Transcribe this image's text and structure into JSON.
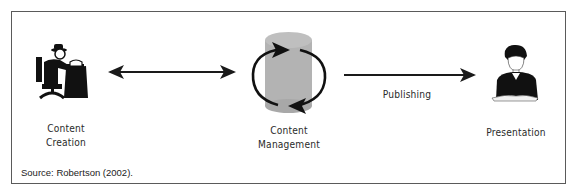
{
  "figure": {
    "nodes": [
      {
        "id": "creation",
        "label_lines": [
          "Content",
          "Creation"
        ],
        "icon": "writer-at-desk-icon"
      },
      {
        "id": "management",
        "label_lines": [
          "Content",
          "Management"
        ],
        "icon": "database-cycle-icon"
      },
      {
        "id": "presentation",
        "label_lines": [
          "Presentation"
        ],
        "icon": "presenter-reading-icon"
      }
    ],
    "edges": [
      {
        "from": "creation",
        "to": "management",
        "type": "bidirectional",
        "label": ""
      },
      {
        "from": "management",
        "to": "presentation",
        "type": "directed",
        "label": "Publishing"
      }
    ],
    "colors": {
      "border": "#5a5a5a",
      "arrow": "#1a1a1a",
      "cylinder": "#b3b3b3",
      "icon": "#111111"
    },
    "source": "Source: Robertson (2002)."
  }
}
